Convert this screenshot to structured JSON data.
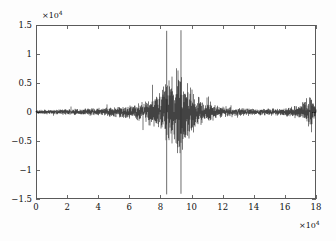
{
  "chart_data": {
    "type": "line",
    "title": "",
    "subtitle": "",
    "xlabel": "",
    "ylabel": "",
    "x_exponent_label": "×10",
    "x_exponent_value": "4",
    "y_exponent_label": "×10",
    "y_exponent_value": "4",
    "xlim": [
      0,
      180000
    ],
    "ylim": [
      -15000,
      15000
    ],
    "grid": false,
    "legend": null,
    "x_ticks": [
      0,
      20000,
      40000,
      60000,
      80000,
      100000,
      120000,
      140000,
      160000,
      180000
    ],
    "x_tick_labels": [
      "0",
      "2",
      "4",
      "6",
      "8",
      "10",
      "12",
      "14",
      "16",
      "18"
    ],
    "y_ticks": [
      -15000,
      -10000,
      -5000,
      0,
      5000,
      10000,
      15000
    ],
    "y_tick_labels": [
      "-1.5",
      "-1",
      "-0.5",
      "0",
      "0.5",
      "1",
      "1.5"
    ],
    "series_name": "waveform",
    "series_color": "#070707",
    "envelope_points": [
      {
        "x": 0,
        "amp": 330
      },
      {
        "x": 4000,
        "amp": 380
      },
      {
        "x": 9000,
        "amp": 430
      },
      {
        "x": 14000,
        "amp": 480
      },
      {
        "x": 20000,
        "amp": 520
      },
      {
        "x": 26000,
        "amp": 560
      },
      {
        "x": 32000,
        "amp": 620
      },
      {
        "x": 38000,
        "amp": 680
      },
      {
        "x": 44000,
        "amp": 760
      },
      {
        "x": 50000,
        "amp": 850
      },
      {
        "x": 56000,
        "amp": 980
      },
      {
        "x": 62000,
        "amp": 1200
      },
      {
        "x": 66000,
        "amp": 1500
      },
      {
        "x": 70000,
        "amp": 1900
      },
      {
        "x": 74000,
        "amp": 2500
      },
      {
        "x": 78000,
        "amp": 3300
      },
      {
        "x": 81000,
        "amp": 4100
      },
      {
        "x": 84000,
        "amp": 5000
      },
      {
        "x": 86000,
        "amp": 5600
      },
      {
        "x": 88000,
        "amp": 6300
      },
      {
        "x": 90000,
        "amp": 6900
      },
      {
        "x": 92000,
        "amp": 7300
      },
      {
        "x": 94000,
        "amp": 6600
      },
      {
        "x": 96000,
        "amp": 5600
      },
      {
        "x": 98000,
        "amp": 4700
      },
      {
        "x": 101000,
        "amp": 3600
      },
      {
        "x": 104000,
        "amp": 2700
      },
      {
        "x": 107000,
        "amp": 2100
      },
      {
        "x": 110000,
        "amp": 1600
      },
      {
        "x": 114000,
        "amp": 1250
      },
      {
        "x": 118000,
        "amp": 1000
      },
      {
        "x": 122000,
        "amp": 850
      },
      {
        "x": 127000,
        "amp": 720
      },
      {
        "x": 132000,
        "amp": 650
      },
      {
        "x": 137000,
        "amp": 600
      },
      {
        "x": 142000,
        "amp": 570
      },
      {
        "x": 147000,
        "amp": 560
      },
      {
        "x": 152000,
        "amp": 580
      },
      {
        "x": 157000,
        "amp": 640
      },
      {
        "x": 162000,
        "amp": 780
      },
      {
        "x": 166000,
        "amp": 1000
      },
      {
        "x": 169000,
        "amp": 1350
      },
      {
        "x": 171500,
        "amp": 1800
      },
      {
        "x": 173500,
        "amp": 2300
      },
      {
        "x": 175000,
        "amp": 2600
      },
      {
        "x": 176500,
        "amp": 2450
      },
      {
        "x": 178000,
        "amp": 1900
      },
      {
        "x": 179000,
        "amp": 1200
      },
      {
        "x": 180000,
        "amp": 500
      }
    ],
    "spikes": [
      {
        "x": 84000,
        "ymin": -14200,
        "ymax": 14000
      },
      {
        "x": 93200,
        "ymin": -14100,
        "ymax": 14100
      }
    ],
    "notable_peaks": [
      {
        "x": 84000,
        "y": 14000,
        "note": "first extreme spike"
      },
      {
        "x": 93200,
        "y": 14100,
        "note": "second extreme spike"
      },
      {
        "x": 92000,
        "y": 8300,
        "note": "envelope maximum"
      },
      {
        "x": 175000,
        "y": 2600,
        "note": "secondary burst"
      }
    ]
  },
  "plot_area": {
    "left": 36,
    "top": 25,
    "right": 316,
    "bottom": 199
  },
  "style": {
    "background": "#fdfdfd",
    "plot_background": "#ffffff",
    "axis_color": "#5a5a5a",
    "trace_color": "#070707",
    "text_color": "#111111"
  }
}
